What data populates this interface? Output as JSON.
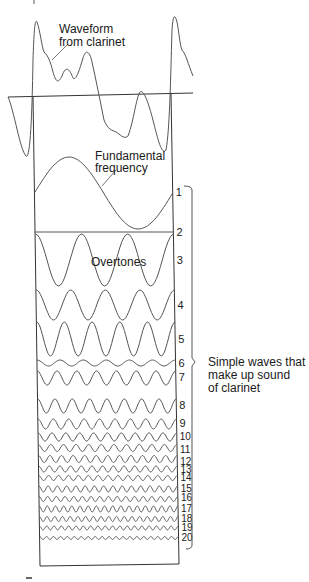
{
  "title_labels": {
    "waveform": [
      "Waveform",
      "from clarinet"
    ],
    "fundamental": [
      "Fundamental",
      "frequency"
    ],
    "overtones": "Overtones",
    "bracket": [
      "Simple waves that",
      "make up sound",
      "of clarinet"
    ]
  },
  "harmonics": [
    {
      "n": "1",
      "label_y": 192,
      "center_y": 193,
      "amp": 36,
      "cycles": 1
    },
    {
      "n": "2",
      "label_y": 232,
      "center_y": 232,
      "amp": 0,
      "cycles": 0
    },
    {
      "n": "3",
      "label_y": 260,
      "center_y": 260,
      "amp": 26,
      "cycles": 3
    },
    {
      "n": "4",
      "label_y": 305,
      "center_y": 305,
      "amp": 15,
      "cycles": 4
    },
    {
      "n": "5",
      "label_y": 339,
      "center_y": 339,
      "amp": 17,
      "cycles": 5
    },
    {
      "n": "6",
      "label_y": 363,
      "center_y": 363,
      "amp": 3,
      "cycles": 6
    },
    {
      "n": "7",
      "label_y": 377,
      "center_y": 378,
      "amp": 7,
      "cycles": 7
    },
    {
      "n": "8",
      "label_y": 405,
      "center_y": 406,
      "amp": 7,
      "cycles": 8
    },
    {
      "n": "9",
      "label_y": 423,
      "center_y": 424,
      "amp": 5,
      "cycles": 9
    },
    {
      "n": "10",
      "label_y": 436,
      "center_y": 437,
      "amp": 4,
      "cycles": 10
    },
    {
      "n": "11",
      "label_y": 449,
      "center_y": 448,
      "amp": 3.5,
      "cycles": 11
    },
    {
      "n": "12",
      "label_y": 461,
      "center_y": 459,
      "amp": 3.5,
      "cycles": 12
    },
    {
      "n": "13",
      "label_y": 469,
      "center_y": 469,
      "amp": 3,
      "cycles": 13
    },
    {
      "n": "14",
      "label_y": 477,
      "center_y": 478,
      "amp": 2.5,
      "cycles": 14
    },
    {
      "n": "15",
      "label_y": 488,
      "center_y": 489,
      "amp": 3,
      "cycles": 15
    },
    {
      "n": "16",
      "label_y": 497,
      "center_y": 499,
      "amp": 2.5,
      "cycles": 16
    },
    {
      "n": "17",
      "label_y": 508,
      "center_y": 509,
      "amp": 3,
      "cycles": 17
    },
    {
      "n": "18",
      "label_y": 518,
      "center_y": 519,
      "amp": 2.5,
      "cycles": 18
    },
    {
      "n": "19",
      "label_y": 527,
      "center_y": 528,
      "amp": 2,
      "cycles": 19
    },
    {
      "n": "20",
      "label_y": 537,
      "center_y": 538,
      "amp": 1.5,
      "cycles": 20
    }
  ],
  "colors": {
    "ink": "#1a1a1a",
    "wave": "#555555",
    "background": "#ffffff"
  }
}
